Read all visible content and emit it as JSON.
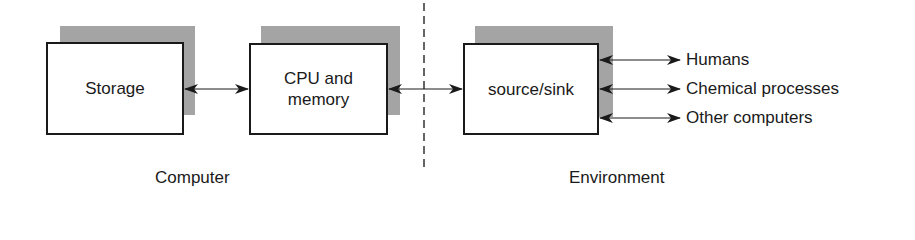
{
  "diagram": {
    "boxes": [
      {
        "id": "storage",
        "label": "Storage"
      },
      {
        "id": "cpu",
        "label_line1": "CPU and",
        "label_line2": "memory"
      },
      {
        "id": "source-sink",
        "label": "source/sink"
      }
    ],
    "external_targets": [
      {
        "label": "Humans"
      },
      {
        "label": "Chemical processes"
      },
      {
        "label": "Other computers"
      }
    ],
    "regions": {
      "left": "Computer",
      "right": "Environment"
    },
    "colors": {
      "line": "#1a1a1a",
      "shadow": "#b8b8b8",
      "background": "#ffffff"
    }
  }
}
